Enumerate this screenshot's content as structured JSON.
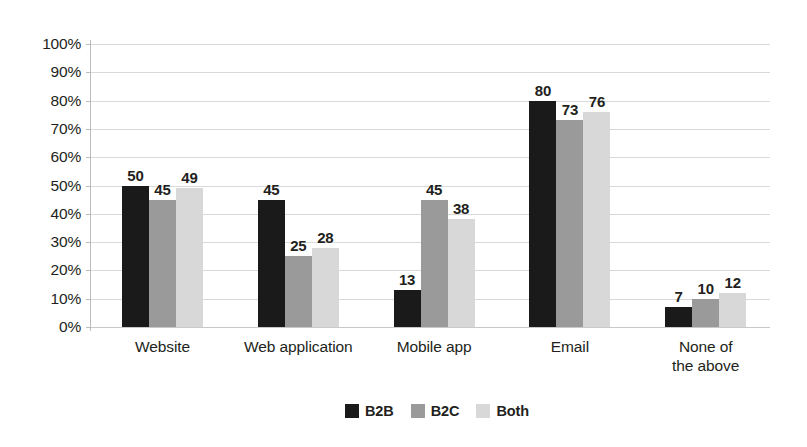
{
  "chart_data": {
    "type": "bar",
    "title": "",
    "subtitle": "",
    "xlabel": "",
    "ylabel": "",
    "categories": [
      "Website",
      "Web application",
      "Mobile app",
      "Email",
      "None of\nthe above"
    ],
    "series": [
      {
        "name": "B2B",
        "color": "#1a1a1a",
        "values": [
          50,
          45,
          13,
          80,
          7
        ]
      },
      {
        "name": "B2C",
        "color": "#9a9a9a",
        "values": [
          45,
          25,
          45,
          73,
          10
        ]
      },
      {
        "name": "Both",
        "color": "#d8d8d8",
        "values": [
          49,
          28,
          38,
          76,
          12
        ]
      }
    ],
    "ylim": [
      0,
      100
    ],
    "ytick_values": [
      0,
      10,
      20,
      30,
      40,
      50,
      60,
      70,
      80,
      90,
      100
    ],
    "ytick_labels": [
      "0%",
      "10%",
      "20%",
      "30%",
      "40%",
      "50%",
      "60%",
      "70%",
      "80%",
      "90%",
      "100%"
    ],
    "grid": true,
    "grid_axis": "y",
    "legend_position": "bottom",
    "data_labels": true,
    "data_label_format": "integer",
    "background_color": "#ffffff",
    "grid_color": "#d9d9d9",
    "axis_color": "#bcbcbc",
    "text_color": "#231f20"
  }
}
